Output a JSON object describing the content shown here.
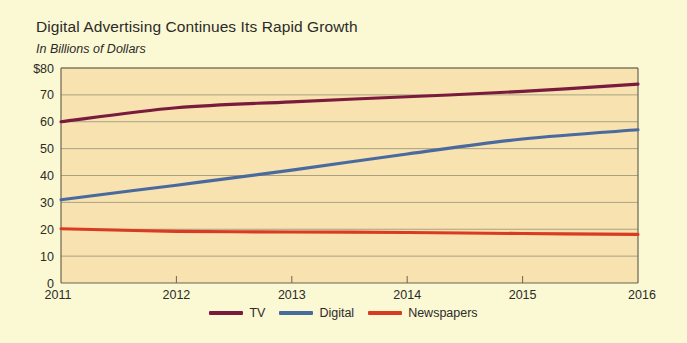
{
  "chart_data": {
    "type": "line",
    "title": "Digital Advertising Continues Its Rapid Growth",
    "subtitle": "In Billions of Dollars",
    "xlabel": "",
    "ylabel": "",
    "x": [
      2011,
      2012,
      2013,
      2014,
      2015,
      2016
    ],
    "categories": [
      "2011",
      "2012",
      "2013",
      "2014",
      "2015",
      "2016"
    ],
    "xlim": [
      2011,
      2016
    ],
    "ylim": [
      0,
      80
    ],
    "ytick_labels": [
      "$80",
      "70",
      "60",
      "50",
      "40",
      "30",
      "20",
      "10",
      "0"
    ],
    "ytick_values": [
      80,
      70,
      60,
      50,
      40,
      30,
      20,
      10,
      0
    ],
    "xtick_labels": [
      "2011",
      "2012",
      "2013",
      "2014",
      "2015",
      "2016"
    ],
    "grid": true,
    "legend_position": "bottom",
    "series": [
      {
        "name": "TV",
        "color": "#7a1b3d",
        "values": [
          60.0,
          65.2,
          67.4,
          69.3,
          71.3,
          74.0
        ]
      },
      {
        "name": "Digital",
        "color": "#4a6a9e",
        "values": [
          31.0,
          36.4,
          42.0,
          48.0,
          53.6,
          57.0
        ]
      },
      {
        "name": "Newspapers",
        "color": "#d93b22",
        "values": [
          20.2,
          19.2,
          19.0,
          18.8,
          18.4,
          18.1
        ]
      }
    ]
  },
  "colors": {
    "page_background": "#fbf8d4",
    "plot_background": "#f7e2b0",
    "gridline": "#a9a282",
    "axis": "#6b6550",
    "text": "#2b2b28",
    "tv": "#7a1b3d",
    "digital": "#4a6a9e",
    "newspapers": "#d93b22"
  },
  "legend": {
    "items": [
      {
        "label": "TV",
        "color": "#7a1b3d"
      },
      {
        "label": "Digital",
        "color": "#4a6a9e"
      },
      {
        "label": "Newspapers",
        "color": "#d93b22"
      }
    ]
  }
}
